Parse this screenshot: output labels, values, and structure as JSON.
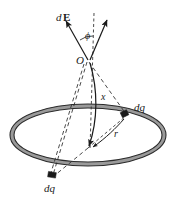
{
  "figure": {
    "background_color": "#ffffff",
    "ink_color": "#1a1a1a",
    "ring_fill_color": "#9a9a9a",
    "width": 178,
    "height": 203,
    "labels": {
      "field_vector_d": "d",
      "field_vector_E": "E",
      "angle": "ϕ",
      "apex_point": "O",
      "axial_distance": "x",
      "radius": "r",
      "charge_element_right": "dq",
      "charge_element_bottom": "dq"
    },
    "elements": {
      "ring": "charged-ring-ellipse",
      "axis": "dashed-vertical-axis",
      "field_arrow": "dE-vector-arrow",
      "axis_arrow": "axis-component-arrow",
      "angle_arc": "phi-angle-arc",
      "r_arrow": "radius-arrow",
      "x_arrow": "axial-distance-arrow",
      "sightline_right": "dashed-line-O-to-right-dq",
      "sightline_bottom": "dashed-line-O-to-bottom-dq"
    }
  }
}
